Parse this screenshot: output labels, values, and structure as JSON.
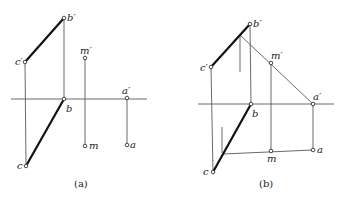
{
  "diagram": {
    "type": "orthographic-projection",
    "panels": [
      {
        "id": "a",
        "caption": "(a)",
        "labels": {
          "b_prime": "b′",
          "c_prime": "c′",
          "m_prime": "m′",
          "a_prime": "a′",
          "b": "b",
          "m": "m",
          "a": "a",
          "c": "c"
        }
      },
      {
        "id": "b",
        "caption": "(b)",
        "labels": {
          "b_prime": "b′",
          "c_prime": "c′",
          "m_prime": "m′",
          "a_prime": "a′",
          "b": "b",
          "m": "m",
          "a": "a",
          "c": "c"
        }
      }
    ]
  }
}
